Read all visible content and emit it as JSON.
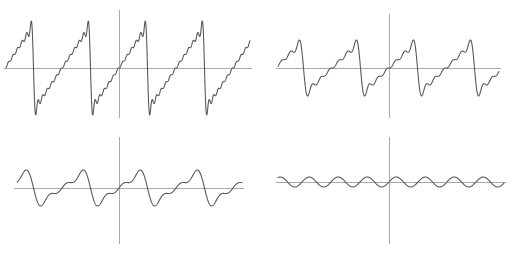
{
  "figure": {
    "width": 512,
    "height": 254,
    "background_color": "#ffffff",
    "curve_color": "#595959",
    "axis_color": "#a9a9a9",
    "panel_count": 4
  },
  "panels": [
    {
      "id": "panel-top-left",
      "name": "top-left-waveform",
      "position": "top-left",
      "origin_x": 119,
      "origin_y": 68,
      "x_axis": {
        "x1": 4,
        "x2": 252,
        "y": 68
      },
      "y_axis": {
        "x": 119,
        "y1": 10,
        "y2": 118
      },
      "curve_x_start": 6,
      "curve_x_end": 250
    },
    {
      "id": "panel-top-right",
      "name": "top-right-waveform",
      "position": "top-right",
      "origin_x": 133,
      "origin_y": 68,
      "x_axis": {
        "x1": 20,
        "x2": 245,
        "y": 68
      },
      "y_axis": {
        "x": 133,
        "y1": 14,
        "y2": 118
      },
      "curve_x_start": 22,
      "curve_x_end": 243
    },
    {
      "id": "panel-bottom-left",
      "name": "bottom-left-waveform",
      "position": "bottom-left",
      "origin_x": 119,
      "origin_y": 61,
      "x_axis": {
        "x1": 14,
        "x2": 244,
        "y": 61
      },
      "y_axis": {
        "x": 119,
        "y1": 10,
        "y2": 117
      },
      "curve_x_start": 17,
      "curve_x_end": 242
    },
    {
      "id": "panel-bottom-right",
      "name": "bottom-right-waveform",
      "position": "bottom-right",
      "origin_x": 133,
      "origin_y": 55,
      "x_axis": {
        "x1": 20,
        "x2": 250,
        "y": 55
      },
      "y_axis": {
        "x": 133,
        "y1": 10,
        "y2": 117
      },
      "curve_x_start": 22,
      "curve_x_end": 248
    }
  ],
  "chart_data": {
    "type": "line",
    "subtitle": "",
    "xlabel": "",
    "ylabel": "",
    "grid": false,
    "legend": "none",
    "axes_shown": [
      "x-axis",
      "y-axis"
    ],
    "panel_layout": "2 x 2",
    "series": [
      {
        "name": "top-left",
        "panel": "top-left",
        "description": "Sharp sawtooth / tangent-like periodic wave with steep vertical drops",
        "waveform": "sawtooth-sharp",
        "harmonics": 12,
        "cycles_visible": 4,
        "period_px": 57,
        "amplitude_px": 47,
        "phase_offset_px": 0,
        "y_peak_px": 21,
        "y_trough_px": 114,
        "x": [
          6,
          20,
          34,
          40,
          41,
          48,
          62,
          76,
          90,
          97,
          98,
          105,
          119,
          133,
          147,
          154,
          155,
          162,
          176,
          190,
          204,
          211,
          212,
          219,
          233,
          250
        ],
        "y": [
          63,
          57,
          24,
          21,
          113,
          108,
          80,
          71,
          62,
          24,
          21,
          113,
          68,
          63,
          24,
          21,
          113,
          108,
          80,
          71,
          62,
          24,
          21,
          113,
          75,
          62
        ]
      },
      {
        "name": "top-right",
        "panel": "top-right",
        "description": "Rounded sawtooth with visible Gibbs ripple, lower amplitude",
        "waveform": "sawtooth-medium",
        "harmonics": 6,
        "cycles_visible": 4,
        "period_px": 57,
        "amplitude_px": 28,
        "phase_offset_px": 0,
        "y_peak_px": 40,
        "y_trough_px": 96,
        "x": [
          22,
          36,
          50,
          57,
          62,
          70,
          84,
          98,
          112,
          119,
          126,
          133,
          147,
          161,
          175,
          182,
          189,
          196,
          210,
          224,
          238,
          243
        ],
        "y": [
          69,
          58,
          42,
          40,
          92,
          96,
          80,
          72,
          45,
          40,
          93,
          68,
          58,
          44,
          40,
          93,
          96,
          82,
          70,
          44,
          93,
          80
        ]
      },
      {
        "name": "bottom-left",
        "panel": "bottom-left",
        "description": "Smooth low-amplitude asymmetric wave, few harmonics",
        "waveform": "sawtooth-smooth",
        "harmonics": 3,
        "cycles_visible": 4,
        "period_px": 57,
        "amplitude_px": 18,
        "phase_offset_px": 0,
        "y_peak_px": 44,
        "y_trough_px": 79,
        "x": [
          17,
          31,
          42,
          50,
          60,
          73,
          87,
          99,
          108,
          117,
          130,
          144,
          156,
          165,
          174,
          187,
          201,
          213,
          222,
          231,
          242
        ],
        "y": [
          70,
          47,
          44,
          72,
          79,
          70,
          50,
          44,
          72,
          79,
          66,
          48,
          44,
          72,
          79,
          69,
          48,
          44,
          73,
          79,
          64
        ]
      },
      {
        "name": "bottom-right",
        "panel": "bottom-right",
        "description": "Very small amplitude near-sinusoidal ripple close to the axis",
        "waveform": "ripple-low-amplitude",
        "harmonics": 1,
        "cycles_visible": 8,
        "period_px": 29,
        "amplitude_px": 5,
        "phase_offset_px": 0,
        "y_peak_px": 50,
        "y_trough_px": 60,
        "x": [
          22,
          36,
          51,
          65,
          80,
          94,
          109,
          123,
          138,
          152,
          167,
          181,
          196,
          210,
          225,
          239,
          248
        ],
        "y": [
          56,
          51,
          59,
          52,
          59,
          52,
          59,
          52,
          56,
          51,
          59,
          52,
          59,
          52,
          59,
          53,
          54
        ]
      }
    ],
    "xlim": [
      -4,
      4
    ],
    "ylim": [
      -1.6,
      1.6
    ]
  }
}
